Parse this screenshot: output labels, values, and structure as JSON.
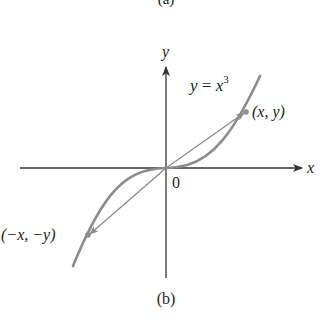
{
  "figure": {
    "top_caption": "(a)",
    "caption": "(b)",
    "axes": {
      "x_label": "x",
      "y_label": "y",
      "origin_label": "0"
    },
    "curve": {
      "equation_lhs": "y",
      "equation_eq": " = ",
      "equation_base": "x",
      "equation_exp": "3",
      "color": "#8c8c8c"
    },
    "points": {
      "positive": {
        "label": "(x, y)"
      },
      "negative": {
        "label": "(−x, −y)"
      }
    },
    "colors": {
      "axis": "#333333",
      "curve": "#8c8c8c",
      "chord": "#8c8c8c",
      "text": "#222222"
    }
  }
}
